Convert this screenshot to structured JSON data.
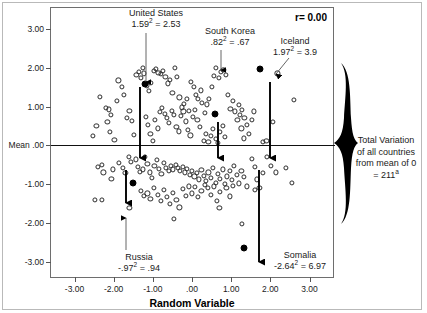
{
  "chart_data": {
    "type": "scatter",
    "title": "",
    "xlabel": "Random Variable",
    "ylabel": "",
    "xlim": [
      -3.6,
      3.6
    ],
    "ylim": [
      -3.4,
      3.55
    ],
    "grid": false,
    "legend": "none",
    "correlation_label": "r= 0.00",
    "mean_line_y": 0,
    "xticks": [
      "-3.00",
      "-2.00",
      "-1.00",
      ".00",
      "1.00",
      "2.00",
      "3.00"
    ],
    "xtick_values": [
      -3,
      -2,
      -1,
      0,
      1,
      2,
      3
    ],
    "yticks": [
      "3.00",
      "2.00",
      "1.00",
      "Mean .00",
      "-1.00",
      "-2.00",
      "-3.00"
    ],
    "ytick_values": [
      3,
      2,
      1,
      0,
      -1,
      -2,
      -3
    ],
    "highlighted_points": [
      {
        "name": "United States",
        "x": -1.19,
        "y": 1.59,
        "deviation": "1.59",
        "squared": "2.53"
      },
      {
        "name": "South Korea",
        "x": 0.58,
        "y": 0.82,
        "deviation": ".82",
        "squared": ".67"
      },
      {
        "name": "Iceland",
        "x": 1.74,
        "y": 1.97,
        "deviation": "1.97",
        "squared": "3.9"
      },
      {
        "name": "Russia",
        "x": -1.5,
        "y": -0.97,
        "deviation": "-.97",
        "squared": ".94"
      },
      {
        "name": "Somalia",
        "x": 1.33,
        "y": -2.64,
        "deviation": "-2.64",
        "squared": "6.97"
      }
    ],
    "points": [
      [
        -2.44,
        0.51
      ],
      [
        -2.52,
        0.24
      ],
      [
        -2.4,
        -0.55
      ],
      [
        -2.48,
        -1.4
      ],
      [
        -2.36,
        1.25
      ],
      [
        -2.2,
        0.97
      ],
      [
        -2.12,
        0.93
      ],
      [
        -2.08,
        0.78
      ],
      [
        -2.16,
        0.6
      ],
      [
        -2.1,
        0.35
      ],
      [
        -2.02,
        -0.62
      ],
      [
        -2.26,
        -0.7
      ],
      [
        -1.98,
        0.15
      ],
      [
        -1.92,
        1.14
      ],
      [
        -1.88,
        1.68
      ],
      [
        -1.8,
        1.52
      ],
      [
        -1.74,
        1.3
      ],
      [
        -1.66,
        0.72
      ],
      [
        -1.6,
        0.9
      ],
      [
        -1.54,
        0.64
      ],
      [
        -1.48,
        0.28
      ],
      [
        -1.42,
        1.82
      ],
      [
        -1.36,
        1.9
      ],
      [
        -1.3,
        1.75
      ],
      [
        -1.26,
        2.0
      ],
      [
        -1.22,
        1.86
      ],
      [
        -1.16,
        1.55
      ],
      [
        -1.1,
        1.4
      ],
      [
        -1.04,
        1.62
      ],
      [
        -0.98,
        1.93
      ],
      [
        -0.92,
        1.97
      ],
      [
        -0.86,
        1.88
      ],
      [
        -0.8,
        1.84
      ],
      [
        -0.74,
        1.92
      ],
      [
        -0.68,
        1.78
      ],
      [
        -0.62,
        1.6
      ],
      [
        -0.56,
        1.7
      ],
      [
        -0.5,
        1.36
      ],
      [
        -0.44,
        2.0
      ],
      [
        -0.38,
        1.78
      ],
      [
        -0.32,
        1.24
      ],
      [
        -0.26,
        0.98
      ],
      [
        -0.2,
        1.08
      ],
      [
        -0.14,
        1.2
      ],
      [
        -0.08,
        0.9
      ],
      [
        -1.18,
        0.74
      ],
      [
        -1.12,
        0.52
      ],
      [
        -1.06,
        0.3
      ],
      [
        -1.0,
        0.12
      ],
      [
        -0.94,
        0.66
      ],
      [
        -0.88,
        0.44
      ],
      [
        -0.82,
        0.86
      ],
      [
        -0.76,
        0.96
      ],
      [
        -0.7,
        0.82
      ],
      [
        -0.64,
        0.7
      ],
      [
        -0.58,
        0.58
      ],
      [
        -0.52,
        0.9
      ],
      [
        -0.46,
        0.78
      ],
      [
        -0.4,
        0.48
      ],
      [
        -0.34,
        0.36
      ],
      [
        -0.28,
        0.76
      ],
      [
        -0.22,
        0.88
      ],
      [
        -0.16,
        0.62
      ],
      [
        -0.1,
        0.4
      ],
      [
        -0.04,
        0.26
      ],
      [
        0.02,
        0.74
      ],
      [
        0.08,
        0.92
      ],
      [
        0.14,
        0.66
      ],
      [
        0.2,
        0.48
      ],
      [
        0.26,
        1.1
      ],
      [
        0.1,
        1.3
      ],
      [
        0.04,
        1.52
      ],
      [
        -0.02,
        1.64
      ],
      [
        0.16,
        1.2
      ],
      [
        0.22,
        1.42
      ],
      [
        0.32,
        0.84
      ],
      [
        0.38,
        1.06
      ],
      [
        0.44,
        1.2
      ],
      [
        0.5,
        1.52
      ],
      [
        0.56,
        1.8
      ],
      [
        0.62,
        2.0
      ],
      [
        0.68,
        1.74
      ],
      [
        0.74,
        1.9
      ],
      [
        0.8,
        1.96
      ],
      [
        0.86,
        1.82
      ],
      [
        0.92,
        1.3
      ],
      [
        0.98,
        0.94
      ],
      [
        1.04,
        1.16
      ],
      [
        1.1,
        0.88
      ],
      [
        1.16,
        0.66
      ],
      [
        1.22,
        0.78
      ],
      [
        1.28,
        0.92
      ],
      [
        1.34,
        0.7
      ],
      [
        1.4,
        0.52
      ],
      [
        1.46,
        0.3
      ],
      [
        1.52,
        0.66
      ],
      [
        1.58,
        0.88
      ],
      [
        1.2,
        1.04
      ],
      [
        1.26,
        0.44
      ],
      [
        1.32,
        0.18
      ],
      [
        2.18,
        1.86
      ],
      [
        2.6,
        1.18
      ],
      [
        2.06,
        0.6
      ],
      [
        1.9,
        0.12
      ],
      [
        1.8,
        0.08
      ],
      [
        0.3,
        0.12
      ],
      [
        0.36,
        0.3
      ],
      [
        0.42,
        0.08
      ],
      [
        0.48,
        0.24
      ],
      [
        0.54,
        0.42
      ],
      [
        0.6,
        0.16
      ],
      [
        0.66,
        0.06
      ],
      [
        0.72,
        0.34
      ],
      [
        0.78,
        0.5
      ],
      [
        0.84,
        0.22
      ],
      [
        -2.3,
        -0.5
      ],
      [
        -2.06,
        -0.86
      ],
      [
        -1.86,
        -0.46
      ],
      [
        -1.76,
        -0.58
      ],
      [
        -1.7,
        -0.72
      ],
      [
        -1.62,
        -0.3
      ],
      [
        -1.56,
        -0.42
      ],
      [
        -1.44,
        -0.36
      ],
      [
        -1.38,
        -0.56
      ],
      [
        -1.32,
        -0.68
      ],
      [
        -1.26,
        -0.62
      ],
      [
        -1.2,
        -0.3
      ],
      [
        -1.14,
        -0.48
      ],
      [
        -1.08,
        -0.7
      ],
      [
        -1.02,
        -0.84
      ],
      [
        -0.96,
        -0.52
      ],
      [
        -0.9,
        -0.38
      ],
      [
        -0.84,
        -0.6
      ],
      [
        -0.78,
        -0.74
      ],
      [
        -0.72,
        -0.46
      ],
      [
        -0.66,
        -0.58
      ],
      [
        -0.6,
        -0.66
      ],
      [
        -0.54,
        -0.54
      ],
      [
        -0.48,
        -0.62
      ],
      [
        -0.42,
        -0.5
      ],
      [
        -0.36,
        -0.58
      ],
      [
        -0.3,
        -0.66
      ],
      [
        -0.24,
        -0.56
      ],
      [
        -0.18,
        -0.7
      ],
      [
        -0.12,
        -0.6
      ],
      [
        -0.06,
        -0.76
      ],
      [
        0.0,
        -0.66
      ],
      [
        0.06,
        -0.8
      ],
      [
        0.12,
        -0.72
      ],
      [
        0.18,
        -0.88
      ],
      [
        0.24,
        -0.64
      ],
      [
        0.3,
        -0.78
      ],
      [
        0.36,
        -0.92
      ],
      [
        0.42,
        -0.7
      ],
      [
        0.48,
        -0.84
      ],
      [
        0.54,
        -0.58
      ],
      [
        0.6,
        -0.96
      ],
      [
        0.66,
        -0.74
      ],
      [
        0.72,
        -0.86
      ],
      [
        0.78,
        -0.62
      ],
      [
        0.84,
        -1.0
      ],
      [
        0.9,
        -0.8
      ],
      [
        0.96,
        -0.66
      ],
      [
        1.02,
        -0.9
      ],
      [
        1.08,
        -0.54
      ],
      [
        1.14,
        -0.76
      ],
      [
        1.2,
        -0.98
      ],
      [
        1.26,
        -0.66
      ],
      [
        1.32,
        -0.82
      ],
      [
        1.4,
        -1.06
      ],
      [
        1.52,
        -0.34
      ],
      [
        1.6,
        -0.56
      ],
      [
        1.66,
        -0.88
      ],
      [
        1.72,
        -1.1
      ],
      [
        1.8,
        -0.72
      ],
      [
        1.92,
        -0.3
      ],
      [
        2.02,
        -0.52
      ],
      [
        2.14,
        -0.7
      ],
      [
        2.4,
        -0.58
      ],
      [
        2.56,
        -0.96
      ],
      [
        -1.3,
        -1.18
      ],
      [
        -1.22,
        -1.3
      ],
      [
        -1.14,
        -1.24
      ],
      [
        -1.06,
        -1.38
      ],
      [
        -0.98,
        -1.1
      ],
      [
        -0.88,
        -1.28
      ],
      [
        -0.8,
        -1.44
      ],
      [
        -0.72,
        -1.16
      ],
      [
        -0.64,
        -1.34
      ],
      [
        -0.56,
        -1.52
      ],
      [
        -0.48,
        -1.22
      ],
      [
        -0.4,
        -1.4
      ],
      [
        -0.32,
        -1.6
      ],
      [
        -0.24,
        -1.12
      ],
      [
        -0.16,
        -1.3
      ],
      [
        -0.08,
        -1.06
      ],
      [
        0.0,
        -1.24
      ],
      [
        0.08,
        -1.08
      ],
      [
        0.16,
        -1.34
      ],
      [
        0.24,
        -1.18
      ],
      [
        0.32,
        -1.02
      ],
      [
        0.4,
        -1.1
      ],
      [
        0.48,
        -1.28
      ],
      [
        0.56,
        -1.06
      ],
      [
        0.64,
        -1.44
      ],
      [
        0.72,
        -1.2
      ],
      [
        0.88,
        -1.1
      ],
      [
        0.96,
        -1.32
      ],
      [
        1.04,
        -1.04
      ],
      [
        1.6,
        -1.14
      ],
      [
        -0.46,
        -1.9
      ],
      [
        1.28,
        -2.02
      ],
      [
        -1.6,
        -1.62
      ],
      [
        -2.3,
        -1.4
      ],
      [
        0.7,
        -1.62
      ]
    ]
  },
  "annotations": [
    {
      "id": "united-states",
      "name": "United States",
      "formula_pre": "1.59",
      "formula_post": " = 2.53"
    },
    {
      "id": "south-korea",
      "name": "South Korea",
      "formula_pre": ".82",
      "formula_post": " = .67"
    },
    {
      "id": "iceland",
      "name": "Iceland",
      "formula_pre": "1.97",
      "formula_post": " = 3.9"
    },
    {
      "id": "russia",
      "name": "Russia",
      "formula_pre": "-.97",
      "formula_post": " = .94"
    },
    {
      "id": "somalia",
      "name": "Somalia",
      "formula_pre": "-2.64",
      "formula_post": " = 6.97"
    }
  ],
  "brace_note": {
    "line1": "Total Variation",
    "line2": "of all countries",
    "line3": "from mean of 0",
    "line4_pre": "= 211",
    "line4_sup": "a"
  },
  "superscript": "2",
  "colors": {
    "ink": "#111111",
    "frame": "#6e6e6e",
    "point_stroke": "#2b2b2b",
    "highlight_fill": "#000000",
    "background": "#ffffff"
  }
}
